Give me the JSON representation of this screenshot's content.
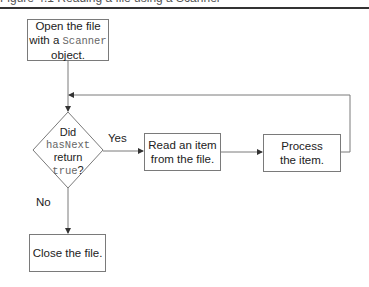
{
  "header": {
    "clipped_caption": "Figure 4.1 Reading a file using a Scanner"
  },
  "flowchart": {
    "nodes": {
      "open": {
        "line1": "Open the file",
        "line2_prefix": "with a ",
        "line2_code": "Scanner",
        "line3": "object."
      },
      "decision": {
        "line1": "Did",
        "line2_code": "hasNext",
        "line3": "return",
        "line4_code": "true",
        "line4_suffix": "?"
      },
      "read": {
        "line1": "Read an item",
        "line2": "from the file."
      },
      "process": {
        "line1": "Process",
        "line2": "the item."
      },
      "close": {
        "line1": "Close the file."
      }
    },
    "edge_labels": {
      "yes": "Yes",
      "no": "No"
    },
    "colors": {
      "stroke": "#7a7a7a",
      "text": "#222222",
      "code_text": "#666666",
      "rule": "#333333"
    }
  }
}
